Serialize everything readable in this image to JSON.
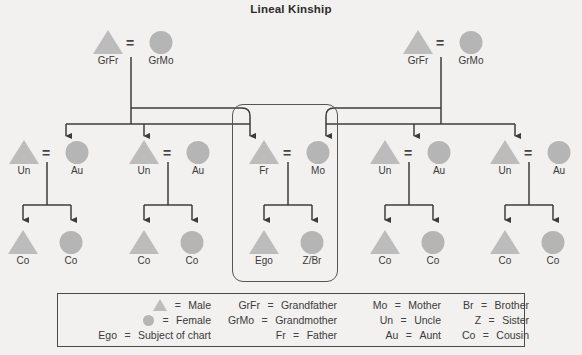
{
  "title": "Lineal Kinship",
  "colors": {
    "background": "#f2f1ef",
    "male_shape": "#bcbcbc",
    "female_shape": "#b5b5b5",
    "line": "#3c3c3c",
    "text": "#3a3a3a",
    "legend_border": "#4a4a4a",
    "highlight_border": "#555555"
  },
  "marriage_symbol": "=",
  "generations": {
    "grandparents": [
      {
        "id": "g1",
        "male_label": "GrFr",
        "female_label": "GrMo"
      },
      {
        "id": "g2",
        "male_label": "GrFr",
        "female_label": "GrMo"
      }
    ],
    "parents": [
      {
        "id": "p1",
        "male_label": "Un",
        "female_label": "Au",
        "descent_target": "female"
      },
      {
        "id": "p2",
        "male_label": "Un",
        "female_label": "Au",
        "descent_target": "male"
      },
      {
        "id": "p3",
        "male_label": "Fr",
        "female_label": "Mo",
        "descent_target": "both",
        "highlighted": true
      },
      {
        "id": "p4",
        "male_label": "Un",
        "female_label": "Au",
        "descent_target": "female"
      },
      {
        "id": "p5",
        "male_label": "Un",
        "female_label": "Au",
        "descent_target": "male"
      }
    ],
    "children": [
      {
        "id": "c1",
        "male_label": "Co",
        "female_label": "Co"
      },
      {
        "id": "c2",
        "male_label": "Co",
        "female_label": "Co"
      },
      {
        "id": "c3",
        "male_label": "Ego",
        "female_label": "Z/Br",
        "highlighted": true
      },
      {
        "id": "c4",
        "male_label": "Co",
        "female_label": "Co"
      },
      {
        "id": "c5",
        "male_label": "Co",
        "female_label": "Co"
      }
    ]
  },
  "legend": {
    "columns": [
      {
        "rows": [
          {
            "key": "",
            "symbol": "male-triangle-icon",
            "eq": "=",
            "value": "Male"
          },
          {
            "key": "",
            "symbol": "female-circle-icon",
            "eq": "=",
            "value": "Female"
          },
          {
            "key": "Ego",
            "symbol": "",
            "eq": "=",
            "value": "Subject of chart"
          }
        ]
      },
      {
        "rows": [
          {
            "key": "GrFr",
            "eq": "=",
            "value": "Grandfather"
          },
          {
            "key": "GrMo",
            "eq": "=",
            "value": "Grandmother"
          },
          {
            "key": "Fr",
            "eq": "=",
            "value": "Father"
          }
        ]
      },
      {
        "rows": [
          {
            "key": "Mo",
            "eq": "=",
            "value": "Mother"
          },
          {
            "key": "Un",
            "eq": "=",
            "value": "Uncle"
          },
          {
            "key": "Au",
            "eq": "=",
            "value": "Aunt"
          }
        ]
      },
      {
        "rows": [
          {
            "key": "Br",
            "eq": "=",
            "value": "Brother"
          },
          {
            "key": "Z",
            "eq": "=",
            "value": "Sister"
          },
          {
            "key": "Co",
            "eq": "=",
            "value": "Cousin"
          }
        ]
      }
    ]
  }
}
